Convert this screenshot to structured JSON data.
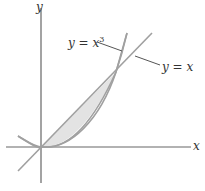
{
  "figure": {
    "axes": {
      "x_label": "x",
      "y_label": "y"
    },
    "curves": [
      {
        "name": "parabola",
        "label_lhs": "y = ",
        "label_var": "x",
        "label_exp": "3"
      },
      {
        "name": "line",
        "label": "y = x"
      }
    ],
    "colors": {
      "axis": "#666666",
      "curve": "#9a9a9a",
      "shade": "#e2e2e2",
      "leader": "#555555",
      "text": "#333333"
    }
  }
}
